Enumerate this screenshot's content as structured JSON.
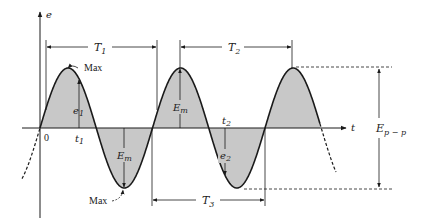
{
  "figure": {
    "type": "sinusoidal waveform diagram",
    "axes": {
      "vertical_label": "e",
      "horizontal_label": "t",
      "origin_label": "0"
    },
    "colors": {
      "line": "#1a1a1a",
      "fill": "#c8c8c8",
      "background": "#ffffff"
    },
    "periods": [
      {
        "label": "T",
        "sub": "1",
        "description": "period measured peak-to-peak start (from origin to next zero-crossing pattern)"
      },
      {
        "label": "T",
        "sub": "2",
        "description": "period measured peak to peak"
      },
      {
        "label": "T",
        "sub": "3",
        "description": "period measured zero-crossing to zero-crossing"
      }
    ],
    "annotations": {
      "max_top": "Max",
      "max_bottom": "Max",
      "e1": {
        "label": "e",
        "sub": "1"
      },
      "t1": {
        "label": "t",
        "sub": "1"
      },
      "e2": {
        "label": "e",
        "sub": "2"
      },
      "t2": {
        "label": "t",
        "sub": "2"
      },
      "em_positive": {
        "label": "E",
        "sub": "m"
      },
      "em_negative": {
        "label": "E",
        "sub": "m"
      },
      "epp": {
        "label": "E",
        "sub": "p − p"
      }
    }
  }
}
